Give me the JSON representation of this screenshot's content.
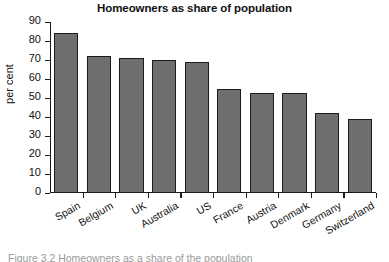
{
  "chart_data": {
    "type": "bar",
    "title": "Homeowners as share of population",
    "xlabel": "",
    "ylabel": "per cent",
    "categories": [
      "Spain",
      "Belgium",
      "UK",
      "Australia",
      "US",
      "France",
      "Austria",
      "Denmark",
      "Germany",
      "Switzerland"
    ],
    "values": [
      84,
      72,
      71,
      70,
      69,
      55,
      52.5,
      52.5,
      42,
      39
    ],
    "ylim": [
      0,
      90
    ],
    "yticks": [
      0,
      10,
      20,
      30,
      40,
      50,
      60,
      70,
      80,
      90
    ],
    "ytick_labels": [
      "0",
      "10",
      "20",
      "30",
      "40",
      "50",
      "60",
      "70",
      "80",
      "90"
    ],
    "grid": false,
    "legend": false,
    "bar_color": "#6f6f6f",
    "bar_edge_color": "#1c1c1c",
    "axis_color": "#1a1a1a",
    "background": "#ffffff"
  },
  "caption": {
    "text": "Figure 3.2  Homeowners as a share of the population"
  }
}
